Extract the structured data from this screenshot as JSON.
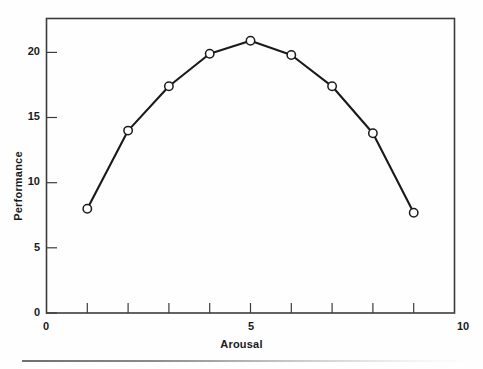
{
  "chart_data": {
    "type": "line",
    "title": "",
    "subtitle": "",
    "xlabel": "Arousal",
    "ylabel": "Performance",
    "x": [
      1,
      2,
      3,
      4,
      5,
      6,
      7,
      8,
      9
    ],
    "values": [
      8.0,
      14.0,
      17.4,
      19.9,
      20.9,
      19.8,
      17.4,
      13.8,
      7.7
    ],
    "series": [
      {
        "name": "Performance vs Arousal",
        "values": [
          8.0,
          14.0,
          17.4,
          19.9,
          20.9,
          19.8,
          17.4,
          13.8,
          7.7
        ]
      }
    ],
    "xlim": [
      0,
      10
    ],
    "ylim": [
      0,
      22.6
    ],
    "xticks": [
      0,
      1,
      2,
      3,
      4,
      5,
      6,
      7,
      8,
      9,
      10
    ],
    "xtick_labels": [
      "0",
      "",
      "",
      "",
      "",
      "5",
      "",
      "",
      "",
      "",
      "10"
    ],
    "yticks": [
      0,
      5,
      10,
      15,
      20
    ],
    "ytick_labels": [
      "0",
      "5",
      "10",
      "15",
      "20"
    ],
    "grid": false,
    "legend": "none",
    "marker": "open-circle",
    "line_color": "#1a1a1a",
    "marker_face_color": "#ffffff",
    "marker_edge_color": "#1a1a1a",
    "frame_color": "#3c3c3c",
    "background_color": "#fefefe"
  },
  "figure": {
    "x_axis_title": "Arousal",
    "y_axis_title": "Performance",
    "x_tick_labels": [
      "0",
      "5",
      "10"
    ],
    "y_tick_labels": [
      "0",
      "5",
      "10",
      "15",
      "20"
    ]
  }
}
